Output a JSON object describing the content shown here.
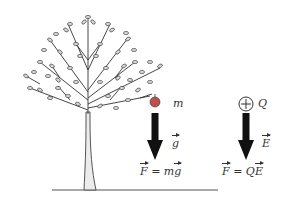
{
  "diagram": {
    "title": "",
    "gravity_side": {
      "object": "apple",
      "mass_label": "m",
      "field_label": "g",
      "force_equation": {
        "lhs": "F",
        "eq": "=",
        "rhs_scalar": "m",
        "rhs_vector": "g"
      }
    },
    "electric_side": {
      "object": "positive-charge",
      "charge_symbol": "+",
      "charge_label": "Q",
      "field_label": "E",
      "force_equation": {
        "lhs": "F",
        "eq": "=",
        "rhs_scalar": "Q",
        "rhs_vector": "E"
      }
    },
    "colors": {
      "arrow": "#111111",
      "apple": "#c0504d",
      "tree_trunk": "#e8e8e8",
      "leaf": "#d9d9d9",
      "ground": "#555555",
      "text": "#333333"
    }
  }
}
